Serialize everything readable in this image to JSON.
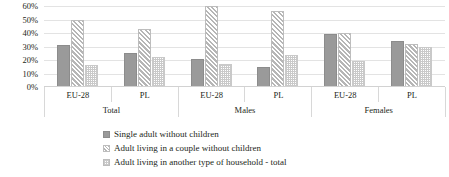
{
  "chart_data": {
    "type": "bar",
    "title": "",
    "xlabel": "",
    "ylabel": "",
    "ylim": [
      0,
      60
    ],
    "ytick_labels": [
      "60%",
      "50%",
      "40%",
      "30%",
      "20%",
      "10%",
      "0%"
    ],
    "ytick_values": [
      60,
      50,
      40,
      30,
      20,
      10,
      0
    ],
    "grid": true,
    "legend_position": "bottom",
    "group_labels": [
      "Total",
      "Males",
      "Females"
    ],
    "categories": [
      "EU-28",
      "PL",
      "EU-28",
      "PL",
      "EU-28",
      "PL"
    ],
    "series": [
      {
        "name": "Single adult without children",
        "values": [
          31,
          25,
          21,
          15,
          39,
          34
        ]
      },
      {
        "name": "Adult living in a couple without children",
        "values": [
          50,
          43,
          60,
          56,
          40,
          32
        ]
      },
      {
        "name": "Adult living in another type of household - total",
        "values": [
          16,
          22,
          17,
          24,
          19,
          30
        ]
      }
    ],
    "colors": {
      "series1": "#9a9a9a",
      "series2": "#b6b6b6",
      "series3": "#c9c9c9",
      "gridline": "#e3e3e3",
      "background": "#ffffff",
      "text": "#231f20"
    }
  }
}
